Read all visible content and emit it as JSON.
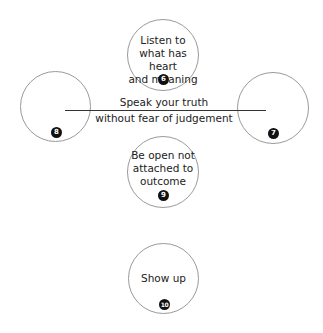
{
  "diagram": {
    "nodes": [
      {
        "id": "listen",
        "text_lines": [
          "Listen to",
          "what has heart",
          "and meaning"
        ],
        "number": "6"
      },
      {
        "id": "right",
        "text_lines": [],
        "number": "7"
      },
      {
        "id": "left",
        "text_lines": [],
        "number": "8"
      },
      {
        "id": "open",
        "text_lines": [
          "Be open not",
          "attached to",
          "outcome"
        ],
        "number": "9"
      },
      {
        "id": "show",
        "text_lines": [
          "Show up"
        ],
        "number": "10"
      }
    ],
    "center_label": {
      "line1": "Speak your truth",
      "line2": "without fear of judgement"
    },
    "colors": {
      "circle_border": "#9a9a9a",
      "badge_fill": "#111111",
      "line": "#333333"
    }
  }
}
